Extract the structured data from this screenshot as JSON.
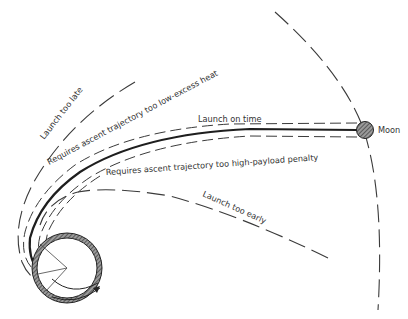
{
  "diagram": {
    "type": "lunar-launch-trajectories",
    "bodies": {
      "earth": {
        "label": ""
      },
      "moon": {
        "label": "Moon"
      }
    },
    "trajectories": [
      {
        "id": "launch-too-late",
        "label": "Launch too late",
        "style": "dashed"
      },
      {
        "id": "ascent-too-low",
        "label": "Requires ascent trajectory too low-excess heat",
        "style": "dashed"
      },
      {
        "id": "launch-on-time",
        "label": "Launch on time",
        "style": "solid"
      },
      {
        "id": "ascent-too-high",
        "label": "Requires ascent trajectory too high-payload penalty",
        "style": "dashed"
      },
      {
        "id": "launch-too-early",
        "label": "Launch too early",
        "style": "dashed"
      }
    ],
    "colors": {
      "line": "#1e1e1e",
      "text": "#333333",
      "moon_fill": "#8a8a8a",
      "background": "#ffffff"
    }
  }
}
